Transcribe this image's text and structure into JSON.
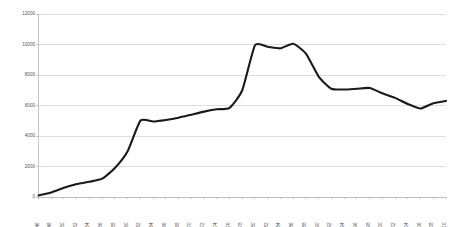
{
  "chart_data": {
    "type": "line",
    "title": "",
    "subtitle": "",
    "xlabel": "",
    "ylabel": "",
    "grid": true,
    "grid_axis": "y",
    "legend": false,
    "legend_position": "none",
    "line_color": "#1a1a1a",
    "grid_color": "#d0d0d0",
    "background_color": "#ffffff",
    "xlim": [
      1946,
      2010
    ],
    "ylim": [
      0,
      12000
    ],
    "ytick_labels": [
      "0",
      "2000",
      "4000",
      "6000",
      "8000",
      "10000",
      "12000"
    ],
    "ytick_values": [
      0,
      2000,
      4000,
      6000,
      8000,
      10000,
      12000
    ],
    "xtick_labels": [
      "1946",
      "1948",
      "1950",
      "1952",
      "1954",
      "1956",
      "1958",
      "1960",
      "1962",
      "1964",
      "1966",
      "1968",
      "1970",
      "1972",
      "1974",
      "1976",
      "1978",
      "1980",
      "1982",
      "1984",
      "1986",
      "1988",
      "1990",
      "1992",
      "1994",
      "1996",
      "1998",
      "2000",
      "2002",
      "2004",
      "2006",
      "2008",
      "2010"
    ],
    "categories": [
      1946,
      1948,
      1950,
      1952,
      1954,
      1956,
      1958,
      1960,
      1962,
      1964,
      1966,
      1968,
      1970,
      1972,
      1974,
      1976,
      1978,
      1980,
      1982,
      1984,
      1986,
      1988,
      1990,
      1992,
      1994,
      1996,
      1998,
      2000,
      2002,
      2004,
      2006,
      2008,
      2010
    ],
    "values": [
      100,
      300,
      600,
      850,
      1000,
      1200,
      1900,
      3000,
      5000,
      4950,
      5050,
      5200,
      5400,
      5600,
      5750,
      5850,
      7000,
      9950,
      9850,
      9750,
      10050,
      9400,
      7900,
      7100,
      7050,
      7100,
      7150,
      6800,
      6500,
      6100,
      5800,
      6150,
      6300
    ]
  }
}
